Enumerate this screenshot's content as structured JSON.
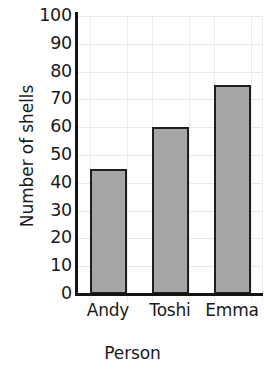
{
  "chart_data": {
    "type": "bar",
    "title": "",
    "subtitle": "",
    "categories": [
      "Andy",
      "Toshi",
      "Emma"
    ],
    "values": [
      45,
      60,
      75
    ],
    "xlabel": "Person",
    "ylabel": "Number of shells",
    "ylim": [
      0,
      100
    ],
    "ytick_labels": [
      "100",
      "90",
      "80",
      "70",
      "60",
      "50",
      "40",
      "30",
      "20",
      "10",
      "0"
    ],
    "ytick_values": [
      100,
      90,
      80,
      70,
      60,
      50,
      40,
      30,
      20,
      10,
      0
    ],
    "ytick_interval": 10,
    "grid": true,
    "grid_axes": "both",
    "legend": false,
    "legend_position": "none",
    "bar_fill_color": "#a6a6a6",
    "bar_edge_color": "#1f1f1f",
    "axis_color": "#141414",
    "gridline_color": "#e8e8e8",
    "background_color": "#ffffff",
    "text_color": "#1a1a1a"
  }
}
